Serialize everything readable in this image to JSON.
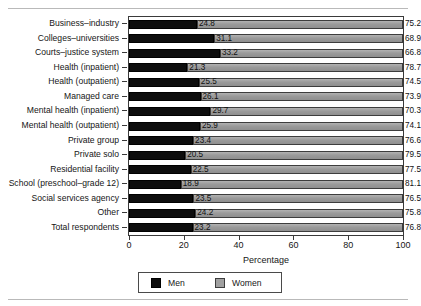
{
  "chart_data": {
    "type": "bar",
    "orientation": "horizontal",
    "stacked": true,
    "title": "",
    "xlabel": "Percentage",
    "ylabel": "",
    "xlim": [
      0,
      100
    ],
    "xticks": [
      0,
      20,
      40,
      60,
      80,
      100
    ],
    "grid": false,
    "legend_position": "bottom",
    "categories": [
      "Business–industry",
      "Colleges–universities",
      "Courts–justice system",
      "Health (inpatient)",
      "Health (outpatient)",
      "Managed care",
      "Mental health (inpatient)",
      "Mental health (outpatient)",
      "Private group",
      "Private solo",
      "Residential facility",
      "School (preschool–grade 12)",
      "Social services agency",
      "Other",
      "Total respondents"
    ],
    "series": [
      {
        "name": "Men",
        "color": "#0d0d0d",
        "values": [
          24.8,
          31.1,
          33.2,
          21.3,
          25.5,
          26.1,
          29.7,
          25.9,
          23.4,
          20.5,
          22.5,
          18.9,
          23.5,
          24.2,
          23.2
        ],
        "labels": [
          "24.8",
          "31.1",
          "33.2",
          "21.3",
          "25.5",
          "26.1",
          "29.7",
          "25.9",
          "23.4",
          "20.5",
          "22.5",
          "18.9",
          "23.5",
          "24.2",
          "23.2"
        ]
      },
      {
        "name": "Women",
        "color": "#9b9b9b",
        "values": [
          75.2,
          68.9,
          66.8,
          78.7,
          74.5,
          73.9,
          70.3,
          74.1,
          76.6,
          79.5,
          77.5,
          81.1,
          76.5,
          75.8,
          76.8
        ],
        "labels": [
          "75.2",
          "68.9",
          "66.8",
          "78.7",
          "74.5",
          "73.9",
          "70.3",
          "74.1",
          "76.6",
          "79.5",
          "77.5",
          "81.1",
          "76.5",
          "75.8",
          "76.8"
        ]
      }
    ]
  },
  "legend": {
    "items": [
      {
        "label": "Men",
        "swatch": "men"
      },
      {
        "label": "Women",
        "swatch": "women"
      }
    ]
  }
}
